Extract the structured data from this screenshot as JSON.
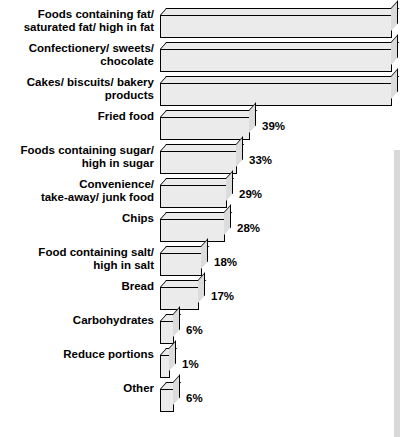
{
  "chart_data": {
    "type": "bar",
    "title": "",
    "xlabel": "",
    "ylabel": "",
    "orientation": "horizontal",
    "grid": false,
    "legend": false,
    "xlim": [
      0,
      100
    ],
    "categories": [
      "Foods containing fat/\nsaturated fat/ high in fat",
      "Confectionery/ sweets/\nchocolate",
      "Cakes/ biscuits/ bakery\nproducts",
      "Fried food",
      "Foods containing sugar/\nhigh in sugar",
      "Convenience/\ntake-away/ junk food",
      "Chips",
      "Food containing salt/\nhigh in salt",
      "Bread",
      "Carbohydrates",
      "Reduce portions",
      "Other"
    ],
    "values": [
      100,
      100,
      100,
      39,
      33,
      29,
      28,
      18,
      17,
      6,
      1,
      6
    ],
    "value_labels": [
      "",
      "",
      "",
      "39%",
      "33%",
      "29%",
      "28%",
      "18%",
      "17%",
      "6%",
      "1%",
      "6%"
    ],
    "colors": {
      "bar_face": "#ebebeb",
      "bar_side": "#dcdcdc",
      "outline": "#000000",
      "text": "#000000",
      "background": "#ffffff",
      "edge_strip": "#d9d9d9"
    }
  }
}
